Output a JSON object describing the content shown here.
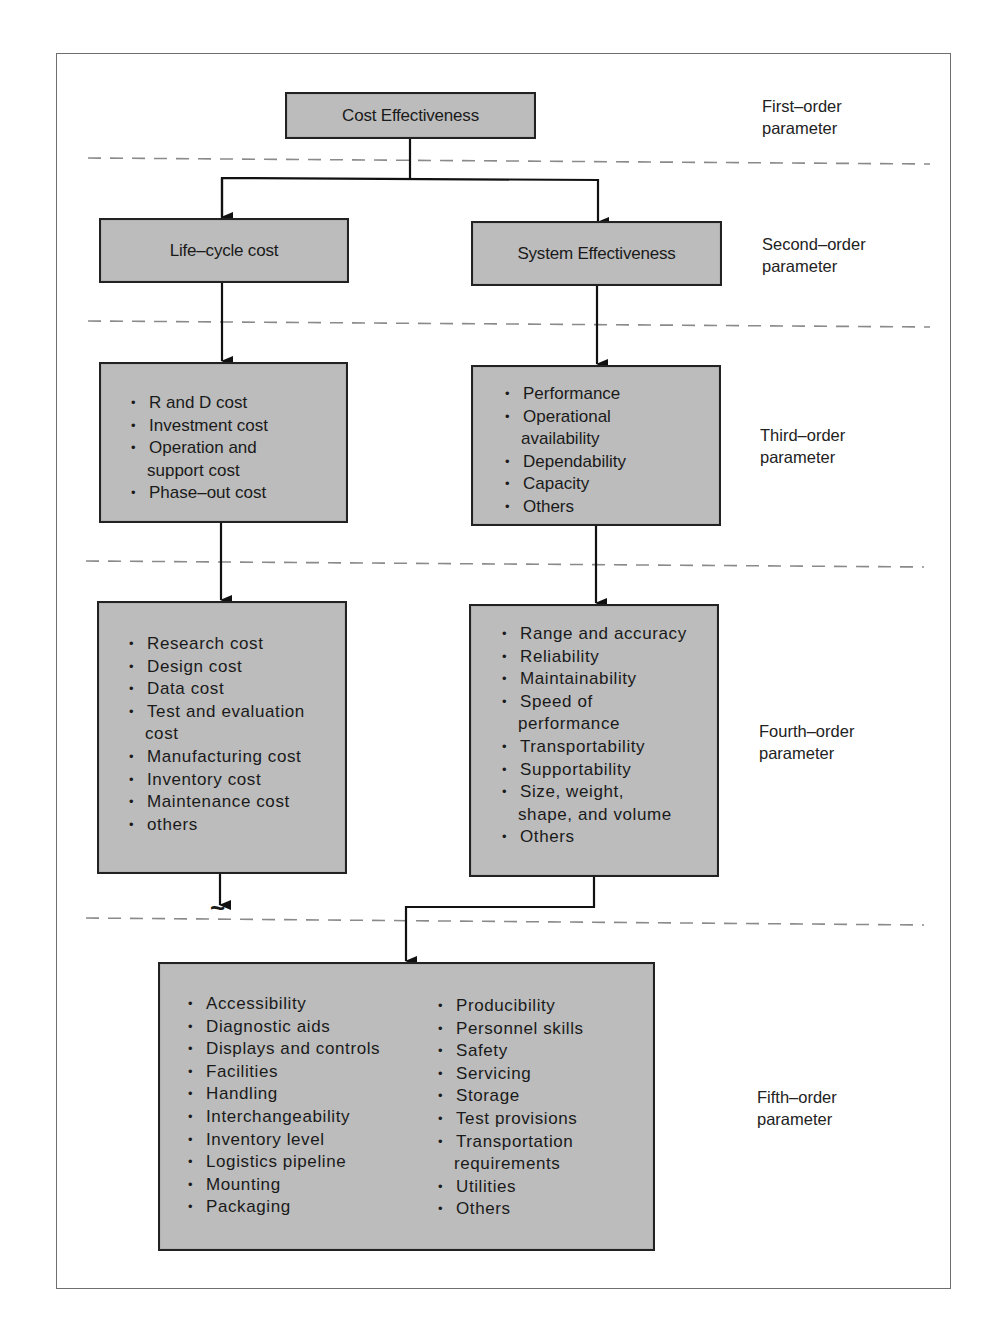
{
  "figure": {
    "levels": [
      {
        "id": "first",
        "label_line1": "First–order",
        "label_line2": "parameter"
      },
      {
        "id": "second",
        "label_line1": "Second–order",
        "label_line2": "parameter"
      },
      {
        "id": "third",
        "label_line1": "Third–order",
        "label_line2": "parameter"
      },
      {
        "id": "fourth",
        "label_line1": "Fourth–order",
        "label_line2": "parameter"
      },
      {
        "id": "fifth",
        "label_line1": "Fifth–order",
        "label_line2": "parameter"
      }
    ],
    "first_order": {
      "title": "Cost Effectiveness"
    },
    "second_order": {
      "left": "Life–cycle cost",
      "right": "System Effectiveness"
    },
    "third_order": {
      "left": [
        "R and D cost",
        "Investment cost",
        "Operation and",
        "support cost",
        "Phase–out cost"
      ],
      "right": [
        "Performance",
        "Operational",
        "availability",
        "Dependability",
        "Capacity",
        "Others"
      ]
    },
    "fourth_order": {
      "left": [
        "Research cost",
        "Design cost",
        "Data cost",
        "Test and evaluation",
        "cost",
        "Manufacturing cost",
        "Inventory cost",
        "Maintenance cost",
        "others"
      ],
      "right": [
        "Range and accuracy",
        "Reliability",
        "Maintainability",
        "Speed of",
        "performance",
        "Transportability",
        "Supportability",
        "Size, weight,",
        "shape, and volume",
        "Others"
      ]
    },
    "fifth_order": {
      "col1": [
        "Accessibility",
        "Diagnostic aids",
        "Displays and controls",
        "Facilities",
        "Handling",
        "Interchangeability",
        "Inventory level",
        "Logistics pipeline",
        "Mounting",
        "Packaging"
      ],
      "col2": [
        "Producibility",
        "Personnel skills",
        "Safety",
        "Servicing",
        "Storage",
        "Test provisions",
        "Transportation",
        "requirements",
        "Utilities",
        "Others"
      ]
    },
    "continuation_mark": "~",
    "colors": {
      "box_fill": "#bcbcbc",
      "box_border": "#222222",
      "dash_line": "#8a8a8a",
      "frame": "#6f6f6f"
    }
  }
}
